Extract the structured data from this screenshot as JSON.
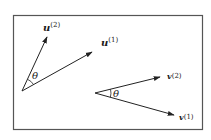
{
  "figure": {
    "frame": {
      "x": 13,
      "y": 15,
      "width": 190,
      "height": 115,
      "stroke": "#555555"
    },
    "stroke_color": "#222222",
    "groups": [
      {
        "name": "u-vectors",
        "origin": [
          22,
          91
        ],
        "vectors": [
          {
            "id": "u2",
            "tip": [
              47,
              37
            ],
            "base": "u",
            "superscript": "(2)",
            "label_pos": [
              43,
              31
            ]
          },
          {
            "id": "u1",
            "tip": [
              92,
              52
            ],
            "base": "u",
            "superscript": "(1)",
            "label_pos": [
              101,
              45
            ]
          }
        ],
        "angle_label": "θ",
        "angle_label_pos": [
          33,
          78
        ]
      },
      {
        "name": "v-vectors",
        "origin": [
          95,
          93
        ],
        "vectors": [
          {
            "id": "v2",
            "tip": [
              160,
              77
            ],
            "base": "v",
            "superscript": "(2)",
            "label_pos": [
              168,
              76
            ]
          },
          {
            "id": "v1",
            "tip": [
              174,
              115
            ],
            "base": "v",
            "superscript": "(1)",
            "label_pos": [
              180,
              120
            ]
          }
        ],
        "angle_label": "θ",
        "angle_label_pos": [
          113,
          97
        ]
      }
    ]
  }
}
